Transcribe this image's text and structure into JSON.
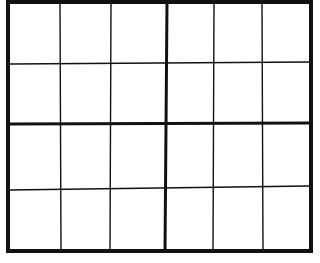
{
  "grid": {
    "columns": 6,
    "rows": 4,
    "block_columns": 3,
    "block_rows": 2,
    "frame": {
      "left": 8,
      "top": 2,
      "right": 311,
      "bottom": 251
    },
    "thin_verticals": [
      {
        "x1": 60,
        "y1": 4,
        "x2": 61,
        "y2": 250
      },
      {
        "x1": 111,
        "y1": 4,
        "x2": 110,
        "y2": 250
      },
      {
        "x1": 214,
        "y1": 4,
        "x2": 213,
        "y2": 250
      },
      {
        "x1": 262,
        "y1": 4,
        "x2": 263,
        "y2": 250
      }
    ],
    "thin_horizontals": [
      {
        "x1": 10,
        "y1": 64,
        "x2": 309,
        "y2": 62
      },
      {
        "x1": 10,
        "y1": 190,
        "x2": 309,
        "y2": 186
      }
    ],
    "thick_vertical": {
      "x1": 167,
      "y1": 3,
      "x2": 165,
      "y2": 251
    },
    "thick_horizontal": {
      "x1": 9,
      "y1": 124,
      "x2": 310,
      "y2": 123
    },
    "line_color": "#111111",
    "background": "#ffffff",
    "cells": [
      [
        "",
        "",
        "",
        "",
        "",
        ""
      ],
      [
        "",
        "",
        "",
        "",
        "",
        ""
      ],
      [
        "",
        "",
        "",
        "",
        "",
        ""
      ],
      [
        "",
        "",
        "",
        "",
        "",
        ""
      ]
    ]
  }
}
